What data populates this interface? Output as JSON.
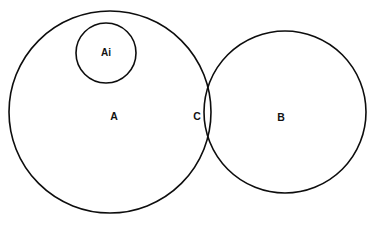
{
  "canvas": {
    "width": 391,
    "height": 227,
    "background_color": "#ffffff",
    "stroke_color": "#0d0d0d",
    "text_color": "#121212"
  },
  "diagram": {
    "type": "venn-diagram",
    "title": "",
    "sets": [
      {
        "id": "A",
        "label": "A",
        "role": "left-set",
        "cx": 110,
        "cy": 112,
        "r": 101,
        "label_x": 114,
        "label_y": 117
      },
      {
        "id": "B",
        "label": "B",
        "role": "right-set",
        "cx": 285,
        "cy": 112,
        "r": 81,
        "label_x": 281,
        "label_y": 118
      },
      {
        "id": "Ai",
        "label": "Ai",
        "role": "subset-of-A",
        "cx": 106,
        "cy": 53,
        "r": 30,
        "label_x": 106,
        "label_y": 53
      }
    ],
    "regions": [
      {
        "id": "C",
        "label": "C",
        "role": "intersection-A-B",
        "label_x": 197,
        "label_y": 117
      }
    ]
  }
}
